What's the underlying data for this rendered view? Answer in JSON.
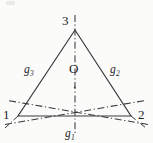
{
  "figure": {
    "kind": "geometry-diagram",
    "background_color": "#fbfbf9",
    "line_color": "#3a383e",
    "text_color": "#25242a",
    "width": 153,
    "height": 143
  },
  "labels": {
    "vertex_top": "3",
    "vertex_bottom_left": "1",
    "vertex_bottom_right": "2",
    "center": "O",
    "axis_1_base": "g",
    "axis_1_sub": "1",
    "axis_2_base": "g",
    "axis_2_sub": "2",
    "axis_3_base": "g",
    "axis_3_sub": "3"
  },
  "geometry": {
    "vertices": {
      "v1": {
        "label": "1",
        "x": 18,
        "y": 116
      },
      "v2": {
        "label": "2",
        "x": 131,
        "y": 116
      },
      "v3": {
        "label": "3",
        "x": 75,
        "y": 30
      }
    },
    "center": {
      "label": "O",
      "x": 74.7,
      "y": 87.3
    },
    "axes": [
      {
        "name": "g1",
        "through_vertex": "3",
        "style": "dash-dot",
        "from": [
          75,
          16
        ],
        "to": [
          75,
          134
        ]
      },
      {
        "name": "g2",
        "through_vertex": "1",
        "style": "dash-dot",
        "from": [
          6,
          124
        ],
        "to": [
          143,
          101
        ]
      },
      {
        "name": "g3",
        "through_vertex": "2",
        "style": "dash-dot",
        "from": [
          147,
          124
        ],
        "to": [
          9,
          101
        ]
      }
    ],
    "edges": [
      {
        "from": "v1",
        "to": "v2",
        "style": "solid"
      },
      {
        "from": "v2",
        "to": "v3",
        "style": "solid"
      },
      {
        "from": "v3",
        "to": "v1",
        "style": "solid"
      }
    ]
  }
}
